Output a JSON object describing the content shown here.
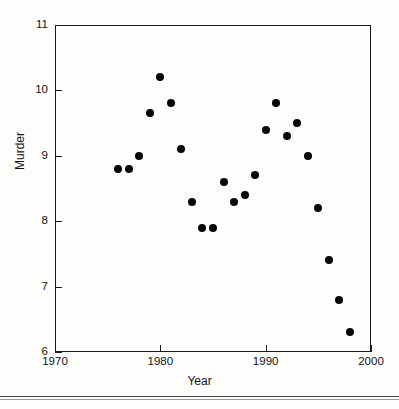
{
  "chart_data": {
    "type": "scatter",
    "title": "",
    "xlabel": "Year",
    "ylabel": "Murder",
    "xlim": [
      1970,
      2000
    ],
    "ylim": [
      6,
      11
    ],
    "xticks": [
      1970,
      1980,
      1990,
      2000
    ],
    "yticks": [
      6,
      7,
      8,
      9,
      10,
      11
    ],
    "grid": false,
    "legend": null,
    "marker": "filled-circle",
    "marker_color": "#050505",
    "frame_color": "#1a1a1a",
    "x": [
      1976,
      1977,
      1978,
      1979,
      1980,
      1981,
      1982,
      1983,
      1984,
      1985,
      1986,
      1987,
      1988,
      1989,
      1990,
      1991,
      1992,
      1993,
      1994,
      1995,
      1996,
      1997,
      1998
    ],
    "y": [
      8.8,
      8.8,
      9.0,
      9.65,
      10.2,
      9.8,
      9.1,
      8.3,
      7.9,
      7.9,
      8.6,
      8.3,
      8.4,
      8.7,
      9.4,
      9.8,
      9.3,
      9.5,
      9.0,
      8.2,
      7.4,
      6.8,
      6.3
    ],
    "points": [
      {
        "x": 1976,
        "y": 8.8
      },
      {
        "x": 1977,
        "y": 8.8
      },
      {
        "x": 1978,
        "y": 9.0
      },
      {
        "x": 1979,
        "y": 9.65
      },
      {
        "x": 1980,
        "y": 10.2
      },
      {
        "x": 1981,
        "y": 9.8
      },
      {
        "x": 1982,
        "y": 9.1
      },
      {
        "x": 1983,
        "y": 8.3
      },
      {
        "x": 1984,
        "y": 7.9
      },
      {
        "x": 1985,
        "y": 7.9
      },
      {
        "x": 1986,
        "y": 8.6
      },
      {
        "x": 1987,
        "y": 8.3
      },
      {
        "x": 1988,
        "y": 8.4
      },
      {
        "x": 1989,
        "y": 8.7
      },
      {
        "x": 1990,
        "y": 9.4
      },
      {
        "x": 1991,
        "y": 9.8
      },
      {
        "x": 1992,
        "y": 9.3
      },
      {
        "x": 1993,
        "y": 9.5
      },
      {
        "x": 1994,
        "y": 9.0
      },
      {
        "x": 1995,
        "y": 8.2
      },
      {
        "x": 1996,
        "y": 7.4
      },
      {
        "x": 1997,
        "y": 6.8
      },
      {
        "x": 1998,
        "y": 6.3
      }
    ]
  },
  "axis": {
    "y_title": "Murder",
    "x_title": "Year",
    "y_tick_labels": [
      "11",
      "10",
      "9",
      "8",
      "7",
      "6"
    ],
    "x_tick_labels": [
      "1970",
      "1980",
      "1990",
      "2000"
    ]
  }
}
